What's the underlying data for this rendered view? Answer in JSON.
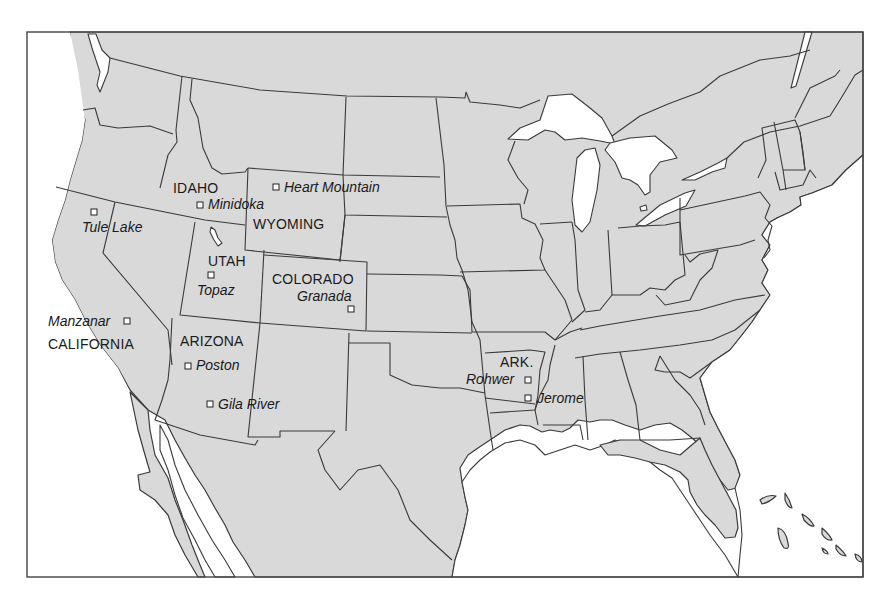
{
  "map": {
    "title": "Japanese American relocation centers",
    "frame": {
      "x": 27,
      "y": 32,
      "width": 836,
      "height": 545
    },
    "colors": {
      "land": "#d9d9d9",
      "water": "#ffffff",
      "border": "#3a3a3a",
      "text": "#1a1a1a"
    },
    "state_labels": [
      {
        "id": "idaho",
        "text": "IDAHO",
        "x": 173,
        "y": 193
      },
      {
        "id": "wyoming",
        "text": "WYOMING",
        "x": 253,
        "y": 229
      },
      {
        "id": "utah",
        "text": "UTAH",
        "x": 208,
        "y": 266
      },
      {
        "id": "colorado",
        "text": "COLORADO",
        "x": 272,
        "y": 284
      },
      {
        "id": "california",
        "text": "CALIFORNIA",
        "x": 48,
        "y": 349
      },
      {
        "id": "arizona",
        "text": "ARIZONA",
        "x": 180,
        "y": 346
      },
      {
        "id": "arkansas",
        "text": "ARK.",
        "x": 500,
        "y": 367
      }
    ],
    "camps": [
      {
        "id": "tule-lake",
        "name": "Tule Lake",
        "marker": {
          "x": 94,
          "y": 212
        },
        "label": {
          "x": 82,
          "y": 232,
          "anchor": "start"
        }
      },
      {
        "id": "minidoka",
        "name": "Minidoka",
        "marker": {
          "x": 200,
          "y": 205
        },
        "label": {
          "x": 208,
          "y": 209,
          "anchor": "start"
        }
      },
      {
        "id": "heart-mountain",
        "name": "Heart Mountain",
        "marker": {
          "x": 276,
          "y": 187
        },
        "label": {
          "x": 284,
          "y": 192,
          "anchor": "start"
        }
      },
      {
        "id": "topaz",
        "name": "Topaz",
        "marker": {
          "x": 211,
          "y": 275
        },
        "label": {
          "x": 197,
          "y": 295,
          "anchor": "start"
        }
      },
      {
        "id": "granada",
        "name": "Granada",
        "marker": {
          "x": 351,
          "y": 309
        },
        "label": {
          "x": 297,
          "y": 301,
          "anchor": "start"
        }
      },
      {
        "id": "manzanar",
        "name": "Manzanar",
        "marker": {
          "x": 127,
          "y": 321
        },
        "label": {
          "x": 48,
          "y": 326,
          "anchor": "start"
        }
      },
      {
        "id": "poston",
        "name": "Poston",
        "marker": {
          "x": 188,
          "y": 366
        },
        "label": {
          "x": 196,
          "y": 370,
          "anchor": "start"
        }
      },
      {
        "id": "gila-river",
        "name": "Gila River",
        "marker": {
          "x": 210,
          "y": 404
        },
        "label": {
          "x": 218,
          "y": 409,
          "anchor": "start"
        }
      },
      {
        "id": "rohwer",
        "name": "Rohwer",
        "marker": {
          "x": 528,
          "y": 380
        },
        "label": {
          "x": 466,
          "y": 384,
          "anchor": "start"
        }
      },
      {
        "id": "jerome",
        "name": "Jerome",
        "marker": {
          "x": 528,
          "y": 398
        },
        "label": {
          "x": 537,
          "y": 403,
          "anchor": "start"
        }
      }
    ]
  }
}
